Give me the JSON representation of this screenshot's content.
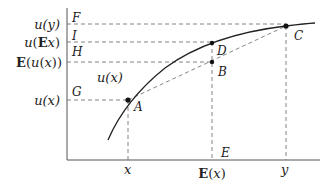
{
  "diagram": {
    "type": "concave utility function / Jensen's inequality",
    "colors": {
      "line": "#333333",
      "dash": "#666666",
      "text": "#222222",
      "background": "#ffffff"
    },
    "curve_label": "u(x)",
    "y_axis_labels": {
      "uy": "u(y)",
      "uEx": "u(Ex)",
      "Eux": "E(u(x))",
      "ux": "u(x)"
    },
    "x_axis_labels": {
      "x": "x",
      "Ex": "E(x)",
      "y": "y"
    },
    "point_labels": {
      "A": "A",
      "B": "B",
      "C": "C",
      "D": "D",
      "E": "E",
      "F": "F",
      "G": "G",
      "H": "H",
      "I": "I"
    }
  }
}
